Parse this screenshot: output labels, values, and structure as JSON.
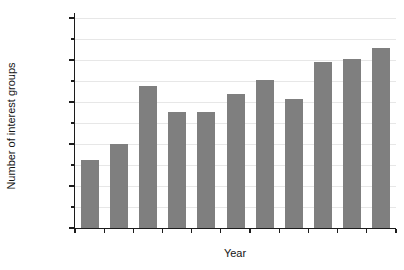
{
  "chart_data": {
    "type": "bar",
    "title": "",
    "xlabel": "Year",
    "ylabel": "Number of interest groups",
    "categories": [
      "1996",
      "1997",
      "1998",
      "1999",
      "2000",
      "2001",
      "2002",
      "2003",
      "2004",
      "2005",
      "2006"
    ],
    "values": [
      8118,
      10013,
      16873,
      13793,
      13865,
      15941,
      17575,
      15317,
      19758,
      20099,
      21460
    ],
    "value_labels": [
      "8,118",
      "10,013",
      "16,873",
      "13,793",
      "13,865",
      "15,941",
      "17,575",
      "15,317",
      "19,758",
      "20,099",
      "21,460"
    ],
    "ylim": [
      0,
      25000
    ],
    "ytick_major_interval": 5000,
    "ytick_minor_interval": 2500,
    "ytick_labels": [
      "0",
      "5,000",
      "10,000",
      "15,000",
      "20,000",
      "25,000"
    ],
    "grid": "horizontal-every-2500",
    "legend": "none",
    "colors": {
      "bar": "#7f7f7f",
      "grid": "#e7e7e7",
      "axis": "#1c1c1c",
      "text": "#141414",
      "background": "#ffffff"
    }
  }
}
